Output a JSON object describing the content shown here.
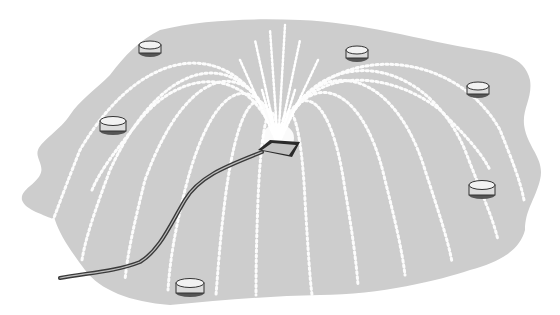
{
  "scene": {
    "description": "Illustration of a fountain sprinkler on a gray pad with water arcs and seven surrounding lights",
    "colors": {
      "background": "#ffffff",
      "ground": "#cdcdcd",
      "water": "#ffffff",
      "hose": "#3a3a3a",
      "light_body": "#e0e0e0",
      "light_outline": "#333333"
    },
    "nozzle": {
      "x": 278,
      "y": 148
    },
    "lights": [
      {
        "x": 150,
        "y": 47
      },
      {
        "x": 357,
        "y": 52
      },
      {
        "x": 478,
        "y": 88
      },
      {
        "x": 113,
        "y": 124
      },
      {
        "x": 482,
        "y": 188
      },
      {
        "x": 190,
        "y": 286
      }
    ]
  }
}
